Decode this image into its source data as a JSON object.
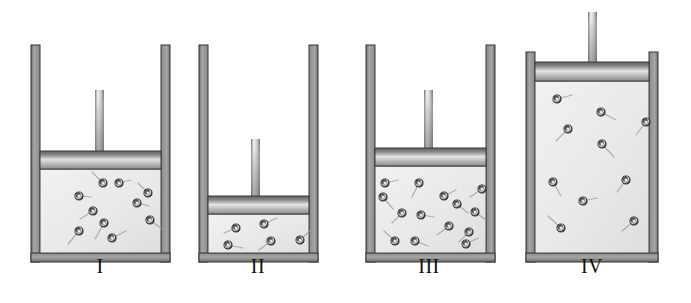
{
  "figure": {
    "background_color": "#ffffff",
    "width": 691,
    "height": 303,
    "wall_color": "#8f8f8f",
    "wall_edge_color": "#3a3a3a",
    "gas_fill_color": "#ececec",
    "gas_border_color": "#4a4a4a",
    "piston_top_color": "#6a6a6a",
    "piston_mid_color": "#d8d8d8",
    "piston_bottom_color": "#9a9a9a",
    "rod_color": "#9a9a9a",
    "molecule_fill_color": "#555555",
    "molecule_core_color": "#e8e8e8",
    "trail_color": "#9a9a9a",
    "label_color": "#111111"
  },
  "cylinders": [
    {
      "id": "cylinder-1",
      "label": "I",
      "label_x": 100,
      "label_y": 268,
      "geometry": {
        "outer_left": 31,
        "outer_right": 170,
        "wall_thickness": 9,
        "top_y": 45,
        "bottom_y": 262,
        "piston_top_y": 151,
        "piston_height": 18,
        "gas_top_y": 169,
        "gas_bottom_y": 253,
        "rod_x": 95,
        "rod_width": 9,
        "rod_top_y": 90
      },
      "molecule_count": 10,
      "molecules": [
        {
          "x": 79,
          "y": 196,
          "tx": 92,
          "ty": 197
        },
        {
          "x": 103,
          "y": 183,
          "tx": 92,
          "ty": 172
        },
        {
          "x": 119,
          "y": 183,
          "tx": 131,
          "ty": 180
        },
        {
          "x": 104,
          "y": 223,
          "tx": 95,
          "ty": 239
        },
        {
          "x": 137,
          "y": 203,
          "tx": 149,
          "ty": 206
        },
        {
          "x": 148,
          "y": 193,
          "tx": 138,
          "ty": 183
        },
        {
          "x": 93,
          "y": 211,
          "tx": 80,
          "ty": 219
        },
        {
          "x": 79,
          "y": 231,
          "tx": 68,
          "ty": 244
        },
        {
          "x": 112,
          "y": 238,
          "tx": 126,
          "ty": 231
        },
        {
          "x": 150,
          "y": 220,
          "tx": 162,
          "ty": 229
        }
      ]
    },
    {
      "id": "cylinder-2",
      "label": "II",
      "label_x": 258,
      "label_y": 268,
      "geometry": {
        "outer_left": 199,
        "outer_right": 318,
        "wall_thickness": 9,
        "top_y": 45,
        "bottom_y": 262,
        "piston_top_y": 196,
        "piston_height": 18,
        "gas_top_y": 214,
        "gas_bottom_y": 253,
        "rod_x": 251,
        "rod_width": 9,
        "rod_top_y": 139
      },
      "molecule_count": 5,
      "molecules": [
        {
          "x": 236,
          "y": 228,
          "tx": 224,
          "ty": 233
        },
        {
          "x": 264,
          "y": 224,
          "tx": 277,
          "ty": 218
        },
        {
          "x": 271,
          "y": 241,
          "tx": 259,
          "ty": 250
        },
        {
          "x": 228,
          "y": 245,
          "tx": 243,
          "ty": 248
        },
        {
          "x": 300,
          "y": 240,
          "tx": 312,
          "ty": 229
        }
      ]
    },
    {
      "id": "cylinder-3",
      "label": "III",
      "label_x": 429,
      "label_y": 268,
      "geometry": {
        "outer_left": 366,
        "outer_right": 495,
        "wall_thickness": 9,
        "top_y": 45,
        "bottom_y": 262,
        "piston_top_y": 148,
        "piston_height": 18,
        "gas_top_y": 166,
        "gas_bottom_y": 253,
        "rod_x": 424,
        "rod_width": 9,
        "rod_top_y": 90
      },
      "molecule_count": 14,
      "molecules": [
        {
          "x": 385,
          "y": 183,
          "tx": 398,
          "ty": 180
        },
        {
          "x": 419,
          "y": 183,
          "tx": 412,
          "ty": 197
        },
        {
          "x": 383,
          "y": 197,
          "tx": 393,
          "ty": 209
        },
        {
          "x": 444,
          "y": 196,
          "tx": 456,
          "ty": 190
        },
        {
          "x": 482,
          "y": 189,
          "tx": 470,
          "ty": 197
        },
        {
          "x": 457,
          "y": 204,
          "tx": 468,
          "ty": 213
        },
        {
          "x": 402,
          "y": 213,
          "tx": 392,
          "ty": 223
        },
        {
          "x": 421,
          "y": 215,
          "tx": 434,
          "ty": 217
        },
        {
          "x": 475,
          "y": 212,
          "tx": 486,
          "ty": 220
        },
        {
          "x": 449,
          "y": 226,
          "tx": 437,
          "ty": 235
        },
        {
          "x": 469,
          "y": 232,
          "tx": 459,
          "ty": 242
        },
        {
          "x": 395,
          "y": 241,
          "tx": 384,
          "ty": 231
        },
        {
          "x": 415,
          "y": 241,
          "tx": 428,
          "ty": 246
        },
        {
          "x": 466,
          "y": 244,
          "tx": 478,
          "ty": 238
        }
      ]
    },
    {
      "id": "cylinder-4",
      "label": "IV",
      "label_x": 592,
      "label_y": 268,
      "geometry": {
        "outer_left": 526,
        "outer_right": 658,
        "wall_thickness": 9,
        "top_y": 52,
        "bottom_y": 262,
        "piston_top_y": 62,
        "piston_height": 19,
        "gas_top_y": 81,
        "gas_bottom_y": 253,
        "rod_x": 588,
        "rod_width": 9,
        "rod_top_y": 12
      },
      "molecule_count": 10,
      "molecules": [
        {
          "x": 557,
          "y": 99,
          "tx": 572,
          "ty": 95
        },
        {
          "x": 601,
          "y": 112,
          "tx": 616,
          "ty": 120
        },
        {
          "x": 568,
          "y": 129,
          "tx": 556,
          "ty": 141
        },
        {
          "x": 646,
          "y": 122,
          "tx": 636,
          "ty": 135
        },
        {
          "x": 602,
          "y": 144,
          "tx": 614,
          "ty": 157
        },
        {
          "x": 553,
          "y": 182,
          "tx": 561,
          "ty": 196
        },
        {
          "x": 626,
          "y": 180,
          "tx": 617,
          "ty": 192
        },
        {
          "x": 583,
          "y": 201,
          "tx": 597,
          "ty": 198
        },
        {
          "x": 561,
          "y": 228,
          "tx": 548,
          "ty": 216
        },
        {
          "x": 634,
          "y": 221,
          "tx": 622,
          "ty": 231
        }
      ]
    }
  ]
}
